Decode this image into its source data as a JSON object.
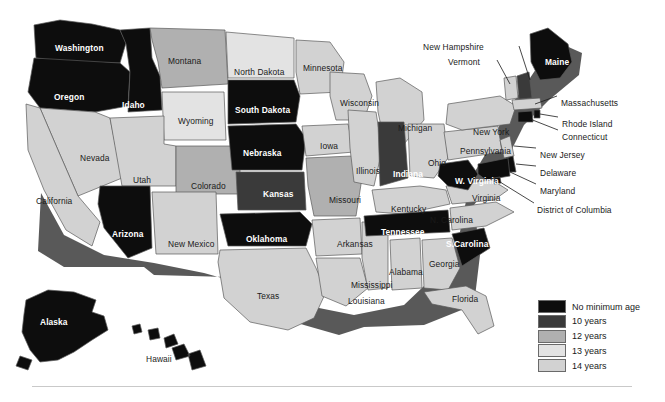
{
  "figure": {
    "type": "choropleth-map",
    "region": "United States",
    "title": ""
  },
  "legend": {
    "name": "minimum-age-legend",
    "items": [
      {
        "label": "No minimum age",
        "color": "#0d0d0d",
        "category": "none"
      },
      {
        "label": "10 years",
        "color": "#3a3a3a",
        "category": "10"
      },
      {
        "label": "12 years",
        "color": "#b0b0b0",
        "category": "12"
      },
      {
        "label": "13 years",
        "color": "#e3e3e3",
        "category": "13"
      },
      {
        "label": "14 years",
        "color": "#d2d2d2",
        "category": "14"
      }
    ]
  },
  "map_data": {
    "type": "choropleth",
    "categories": [
      "No minimum age",
      "10 years",
      "12 years",
      "13 years",
      "14 years"
    ],
    "colors": {
      "none": "#0d0d0d",
      "10": "#3a3a3a",
      "12": "#b0b0b0",
      "13": "#e3e3e3",
      "14": "#d2d2d2"
    },
    "states": [
      {
        "name": "Washington",
        "category": "none",
        "label_x": 55,
        "label_y": 44,
        "label_style": "light"
      },
      {
        "name": "Oregon",
        "category": "none",
        "label_x": 54,
        "label_y": 93,
        "label_style": "light"
      },
      {
        "name": "Idaho",
        "category": "none",
        "label_x": 122,
        "label_y": 101,
        "label_style": "light"
      },
      {
        "name": "Montana",
        "category": "12",
        "label_x": 168,
        "label_y": 57,
        "label_style": "dark"
      },
      {
        "name": "Wyoming",
        "category": "13",
        "label_x": 178,
        "label_y": 117,
        "label_style": "dark"
      },
      {
        "name": "Nevada",
        "category": "14",
        "label_x": 80,
        "label_y": 154,
        "label_style": "dark"
      },
      {
        "name": "California",
        "category": "14",
        "label_x": 36,
        "label_y": 197,
        "label_style": "dark"
      },
      {
        "name": "Utah",
        "category": "14",
        "label_x": 133,
        "label_y": 176,
        "label_style": "dark"
      },
      {
        "name": "Arizona",
        "category": "none",
        "label_x": 112,
        "label_y": 230,
        "label_style": "light"
      },
      {
        "name": "Colorado",
        "category": "12",
        "label_x": 191,
        "label_y": 182,
        "label_style": "dark"
      },
      {
        "name": "New Mexico",
        "category": "14",
        "label_x": 168,
        "label_y": 240,
        "label_style": "dark"
      },
      {
        "name": "North Dakota",
        "category": "13",
        "label_x": 234,
        "label_y": 68,
        "label_style": "dark"
      },
      {
        "name": "South Dakota",
        "category": "none",
        "label_x": 235,
        "label_y": 106,
        "label_style": "light"
      },
      {
        "name": "Nebraska",
        "category": "none",
        "label_x": 243,
        "label_y": 149,
        "label_style": "light"
      },
      {
        "name": "Kansas",
        "category": "10",
        "label_x": 263,
        "label_y": 190,
        "label_style": "light"
      },
      {
        "name": "Oklahoma",
        "category": "none",
        "label_x": 246,
        "label_y": 235,
        "label_style": "light"
      },
      {
        "name": "Texas",
        "category": "14",
        "label_x": 257,
        "label_y": 292,
        "label_style": "dark"
      },
      {
        "name": "Minnesota",
        "category": "14",
        "label_x": 303,
        "label_y": 64,
        "label_style": "dark"
      },
      {
        "name": "Iowa",
        "category": "14",
        "label_x": 320,
        "label_y": 142,
        "label_style": "dark"
      },
      {
        "name": "Missouri",
        "category": "12",
        "label_x": 329,
        "label_y": 196,
        "label_style": "dark"
      },
      {
        "name": "Arkansas",
        "category": "14",
        "label_x": 337,
        "label_y": 240,
        "label_style": "dark"
      },
      {
        "name": "Louisiana",
        "category": "14",
        "label_x": 348,
        "label_y": 297,
        "label_style": "dark"
      },
      {
        "name": "Wisconsin",
        "category": "14",
        "label_x": 340,
        "label_y": 99,
        "label_style": "dark"
      },
      {
        "name": "Illinois",
        "category": "14",
        "label_x": 356,
        "label_y": 167,
        "label_style": "dark"
      },
      {
        "name": "Mississippi",
        "category": "14",
        "label_x": 351,
        "label_y": 281,
        "label_style": "dark"
      },
      {
        "name": "Michigan",
        "category": "14",
        "label_x": 398,
        "label_y": 124,
        "label_style": "dark"
      },
      {
        "name": "Indiana",
        "category": "10",
        "label_x": 393,
        "label_y": 170,
        "label_style": "light"
      },
      {
        "name": "Ohio",
        "category": "14",
        "label_x": 428,
        "label_y": 159,
        "label_style": "dark"
      },
      {
        "name": "Kentucky",
        "category": "14",
        "label_x": 391,
        "label_y": 205,
        "label_style": "dark"
      },
      {
        "name": "Tennessee",
        "category": "none",
        "label_x": 381,
        "label_y": 228,
        "label_style": "light"
      },
      {
        "name": "Alabama",
        "category": "14",
        "label_x": 389,
        "label_y": 268,
        "label_style": "dark"
      },
      {
        "name": "Georgia",
        "category": "14",
        "label_x": 429,
        "label_y": 260,
        "label_style": "dark"
      },
      {
        "name": "Florida",
        "category": "14",
        "label_x": 452,
        "label_y": 295,
        "label_style": "dark"
      },
      {
        "name": "S.Carolina",
        "category": "none",
        "label_x": 446,
        "label_y": 240,
        "label_style": "light"
      },
      {
        "name": "N. Carolina",
        "category": "14",
        "label_x": 430,
        "label_y": 216,
        "label_style": "dark"
      },
      {
        "name": "Virginia",
        "category": "14",
        "label_x": 472,
        "label_y": 194,
        "label_style": "dark"
      },
      {
        "name": "W. Virginia",
        "category": "none",
        "label_x": 455,
        "label_y": 177,
        "label_style": "light"
      },
      {
        "name": "Pennsylvania",
        "category": "14",
        "label_x": 460,
        "label_y": 147,
        "label_style": "dark"
      },
      {
        "name": "New York",
        "category": "14",
        "label_x": 473,
        "label_y": 128,
        "label_style": "dark"
      },
      {
        "name": "Maine",
        "category": "none",
        "label_x": 545,
        "label_y": 58,
        "label_style": "light"
      },
      {
        "name": "Alaska",
        "category": "none",
        "label_x": 40,
        "label_y": 318,
        "label_style": "light"
      },
      {
        "name": "Hawaii",
        "category": "none",
        "label_x": 146,
        "label_y": 355,
        "label_style": "dark"
      }
    ],
    "callout_labels": [
      {
        "name": "New Hampshire",
        "category": "10",
        "x": 423,
        "y": 43
      },
      {
        "name": "Vermont",
        "category": "14",
        "x": 448,
        "y": 58
      },
      {
        "name": "Massachusetts",
        "category": "14",
        "x": 561,
        "y": 99
      },
      {
        "name": "Rhode Island",
        "category": "none",
        "x": 562,
        "y": 120
      },
      {
        "name": "Connecticut",
        "category": "none",
        "x": 562,
        "y": 133
      },
      {
        "name": "New Jersey",
        "category": "14",
        "x": 540,
        "y": 151
      },
      {
        "name": "Delaware",
        "category": "none",
        "x": 540,
        "y": 169
      },
      {
        "name": "Maryland",
        "category": "none",
        "x": 540,
        "y": 187
      },
      {
        "name": "District of Columbia",
        "category": "none",
        "x": 537,
        "y": 206
      }
    ]
  }
}
